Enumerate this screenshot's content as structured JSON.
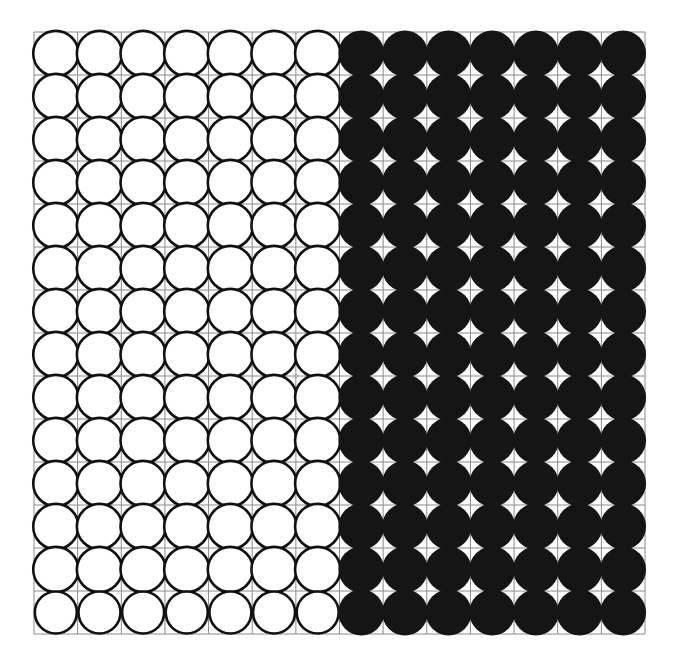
{
  "figure": {
    "background_color": "#ffffff"
  },
  "chart_data": {
    "type": "heatmap",
    "subtitle": "",
    "xlabel": "",
    "ylabel": "",
    "columns": 14,
    "rows": 14,
    "x": [
      1,
      2,
      3,
      4,
      5,
      6,
      7,
      8,
      9,
      10,
      11,
      12,
      13,
      14
    ],
    "y": [
      1,
      2,
      3,
      4,
      5,
      6,
      7,
      8,
      9,
      10,
      11,
      12,
      13,
      14
    ],
    "categories": [
      "1",
      "2",
      "3",
      "4",
      "5",
      "6",
      "7",
      "8",
      "9",
      "10",
      "11",
      "12",
      "13",
      "14"
    ],
    "tick_labels_visible": false,
    "grid": true,
    "legend": "none",
    "values": [
      [
        0,
        0,
        0,
        0,
        0,
        0,
        0,
        1,
        1,
        1,
        1,
        1,
        1,
        1
      ],
      [
        0,
        0,
        0,
        0,
        0,
        0,
        0,
        1,
        1,
        1,
        1,
        1,
        1,
        1
      ],
      [
        0,
        0,
        0,
        0,
        0,
        0,
        0,
        1,
        1,
        1,
        1,
        1,
        1,
        1
      ],
      [
        0,
        0,
        0,
        0,
        0,
        0,
        0,
        1,
        1,
        1,
        1,
        1,
        1,
        1
      ],
      [
        0,
        0,
        0,
        0,
        0,
        0,
        0,
        1,
        1,
        1,
        1,
        1,
        1,
        1
      ],
      [
        0,
        0,
        0,
        0,
        0,
        0,
        0,
        1,
        1,
        1,
        1,
        1,
        1,
        1
      ],
      [
        0,
        0,
        0,
        0,
        0,
        0,
        0,
        1,
        1,
        1,
        1,
        1,
        1,
        1
      ],
      [
        0,
        0,
        0,
        0,
        0,
        0,
        0,
        1,
        1,
        1,
        1,
        1,
        1,
        1
      ],
      [
        0,
        0,
        0,
        0,
        0,
        0,
        0,
        1,
        1,
        1,
        1,
        1,
        1,
        1
      ],
      [
        0,
        0,
        0,
        0,
        0,
        0,
        0,
        1,
        1,
        1,
        1,
        1,
        1,
        1
      ],
      [
        0,
        0,
        0,
        0,
        0,
        0,
        0,
        1,
        1,
        1,
        1,
        1,
        1,
        1
      ],
      [
        0,
        0,
        0,
        0,
        0,
        0,
        0,
        1,
        1,
        1,
        1,
        1,
        1,
        1
      ],
      [
        0,
        0,
        0,
        0,
        0,
        0,
        0,
        1,
        1,
        1,
        1,
        1,
        1,
        1
      ],
      [
        0,
        0,
        0,
        0,
        0,
        0,
        0,
        1,
        1,
        1,
        1,
        1,
        1,
        1
      ]
    ],
    "value_legend": {
      "0": "unfilled circle (white fill, black outline)",
      "1": "filled circle (solid black)"
    },
    "colors": {
      "background": "#ffffff",
      "gridline": "#8a8a8a",
      "circle_outline": "#111111",
      "circle_fill_empty": "#ffffff",
      "circle_fill_solid": "#151515"
    },
    "geometry": {
      "grid_left": 34,
      "grid_top": 32,
      "grid_right": 645,
      "grid_bottom": 634,
      "cell_width": 43.64,
      "cell_height": 43.0,
      "empty_circle_radius": 22.6,
      "solid_circle_radius": 22.9,
      "last_row_circle_radius": 21.0,
      "gridline_width": 1,
      "circle_stroke_width": 2.6
    },
    "split": {
      "empty_columns": [
        1,
        2,
        3,
        4,
        5,
        6,
        7
      ],
      "filled_columns": [
        8,
        9,
        10,
        11,
        12,
        13,
        14
      ],
      "boundary_x_px": 343
    }
  }
}
